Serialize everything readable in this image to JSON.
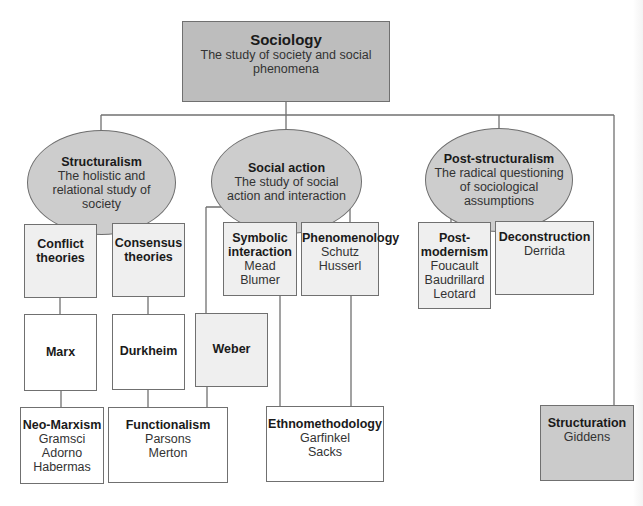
{
  "diagram": {
    "root": {
      "title": "Sociology",
      "subtitle_line1": "The study of society and social",
      "subtitle_line2": "phenomena"
    },
    "branches": [
      {
        "title": "Structuralism",
        "lines": [
          "The holistic and",
          "relational study of",
          "society"
        ]
      },
      {
        "title": "Social action",
        "lines": [
          "The study of social",
          "action and interaction"
        ]
      },
      {
        "title": "Post-structuralism",
        "lines": [
          "The radical questioning",
          "of sociological",
          "assumptions"
        ]
      }
    ],
    "boxes": {
      "conflict": {
        "title_l1": "Conflict",
        "title_l2": "theories"
      },
      "consensus": {
        "title_l1": "Consensus",
        "title_l2": "theories"
      },
      "marx": {
        "title": "Marx"
      },
      "durkheim": {
        "title": "Durkheim"
      },
      "weber": {
        "title": "Weber"
      },
      "neo_marxism": {
        "title": "Neo-Marxism",
        "names": [
          "Gramsci",
          "Adorno",
          "Habermas"
        ]
      },
      "functionalism": {
        "title": "Functionalism",
        "names": [
          "Parsons",
          "Merton"
        ]
      },
      "symbolic": {
        "title_l1": "Symbolic",
        "title_l2": "interaction",
        "names": [
          "Mead",
          "Blumer"
        ]
      },
      "phenomenology": {
        "title": "Phenomenology",
        "names": [
          "Schutz",
          "Husserl"
        ]
      },
      "ethnomethodology": {
        "title": "Ethnomethodology",
        "names": [
          "Garfinkel",
          "Sacks"
        ]
      },
      "postmodernism": {
        "title_l1": "Post-",
        "title_l2": "modernism",
        "names": [
          "Foucault",
          "Baudrillard",
          "Leotard"
        ]
      },
      "deconstruction": {
        "title": "Deconstruction",
        "names": [
          "Derrida"
        ]
      },
      "structuration": {
        "title": "Structuration",
        "names": [
          "Giddens"
        ]
      }
    },
    "colors": {
      "root_fill": "#bdbdbd",
      "ellipse_fill": "#cdcdcd",
      "light_box_fill": "#efefef",
      "structuration_fill": "#cbcbcb",
      "line": "#707070"
    }
  }
}
